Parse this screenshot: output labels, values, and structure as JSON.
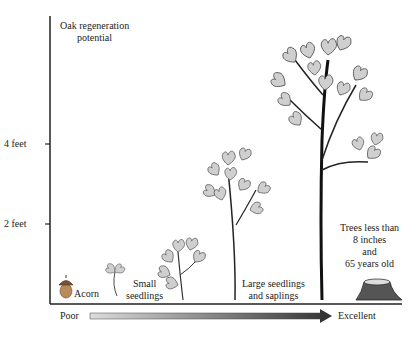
{
  "title": {
    "line1": "Oak regeneration",
    "line2": "potential"
  },
  "y_axis": {
    "ticks": [
      {
        "label": "4 feet"
      },
      {
        "label": "2 feet"
      }
    ]
  },
  "stages": [
    {
      "label1": "Acorn",
      "label2": ""
    },
    {
      "label1": "Small",
      "label2": "seedlings"
    },
    {
      "label1": "Large seedlings",
      "label2": "and saplings"
    },
    {
      "label1": "Trees less than",
      "label2": "8 inches",
      "label3": "and",
      "label4": "65 years old"
    }
  ],
  "scale": {
    "left": "Poor",
    "right": "Excellent"
  },
  "colors": {
    "leaf_fill": "#cfcfcf",
    "leaf_stroke": "#555555",
    "axis": "#222222",
    "arrow_dark": "#333333",
    "arrow_light": "#d8d8d8"
  }
}
